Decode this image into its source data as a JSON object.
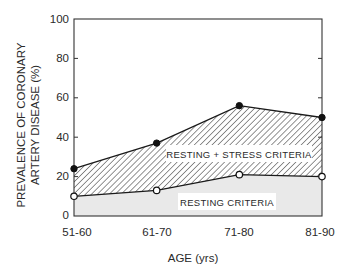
{
  "chart_data": {
    "type": "area",
    "title": "",
    "xlabel": "AGE (yrs)",
    "ylabel_lines": [
      "PREVALENCE OF CORONARY",
      "ARTERY DISEASE (%)"
    ],
    "ylabel": "PREVALENCE OF CORONARY ARTERY DISEASE (%)",
    "categories": [
      "51-60",
      "61-70",
      "71-80",
      "81-90"
    ],
    "yticks": [
      0,
      20,
      40,
      60,
      80,
      100
    ],
    "ylim": [
      0,
      100
    ],
    "grid": false,
    "legend": "none (in-plot region labels)",
    "series": [
      {
        "name": "Resting + stress criteria",
        "marker": "filled-circle",
        "values": [
          24,
          37,
          56,
          50
        ],
        "fill": "diagonal-hatch"
      },
      {
        "name": "Resting criteria",
        "marker": "open-circle",
        "values": [
          10,
          13,
          21,
          20
        ],
        "fill": "light-gray"
      }
    ],
    "annotations": [
      {
        "text": "RESTING + STRESS CRITERIA",
        "region": "between series"
      },
      {
        "text": "RESTING CRITERIA",
        "region": "below resting series"
      }
    ]
  },
  "colors": {
    "line": "#1a1a1a",
    "lower_fill": "#e9e9e9",
    "hatch": "#3a3a3a",
    "label_bg": "#ffffff",
    "text": "#2a2a2a"
  }
}
